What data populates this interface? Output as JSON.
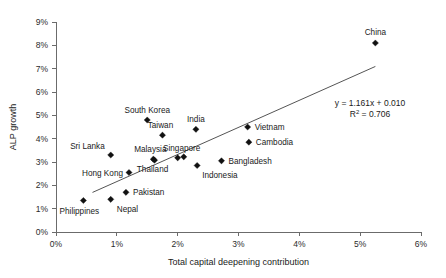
{
  "chart_data": {
    "type": "scatter",
    "title": "",
    "xlabel": "Total capital deepening contribution",
    "ylabel": "ALP growth",
    "xlim": [
      0,
      6
    ],
    "ylim": [
      0,
      9
    ],
    "xunit": "%",
    "yunit": "%",
    "grid": false,
    "legend": "none",
    "xticks": [
      "0%",
      "1%",
      "2%",
      "3%",
      "4%",
      "5%",
      "6%"
    ],
    "xtickvalues": [
      0,
      1,
      2,
      3,
      4,
      5,
      6
    ],
    "yticks": [
      "0%",
      "1%",
      "2%",
      "3%",
      "4%",
      "5%",
      "6%",
      "7%",
      "8%",
      "9%"
    ],
    "ytickvalues": [
      0,
      1,
      2,
      3,
      4,
      5,
      6,
      7,
      8,
      9
    ],
    "points": [
      {
        "label": "Philippines",
        "x": 0.45,
        "y": 1.35,
        "label_dx": -4,
        "label_dy": 13,
        "anchor": "middle"
      },
      {
        "label": "Nepal",
        "x": 0.9,
        "y": 1.4,
        "label_dx": 6,
        "label_dy": 13,
        "anchor": "start"
      },
      {
        "label": "Sri Lanka",
        "x": 0.9,
        "y": 3.3,
        "label_dx": -6,
        "label_dy": -6,
        "anchor": "end"
      },
      {
        "label": "Pakistan",
        "x": 1.15,
        "y": 1.7,
        "label_dx": 7,
        "label_dy": 3,
        "anchor": "start"
      },
      {
        "label": "Hong Kong",
        "x": 1.2,
        "y": 2.55,
        "label_dx": -6,
        "label_dy": 3,
        "anchor": "end"
      },
      {
        "label": "South Korea",
        "x": 1.5,
        "y": 4.8,
        "label_dx": 0,
        "label_dy": -7,
        "anchor": "middle"
      },
      {
        "label": "Malaysia",
        "x": 1.6,
        "y": 3.12,
        "label_dx": -3,
        "label_dy": -7,
        "anchor": "middle"
      },
      {
        "label": "Thailand",
        "x": 1.62,
        "y": 3.08,
        "label_dx": -2,
        "label_dy": 12,
        "anchor": "middle"
      },
      {
        "label": "Taiwan",
        "x": 1.75,
        "y": 4.15,
        "label_dx": -2,
        "label_dy": -7,
        "anchor": "middle"
      },
      {
        "label": "Singapore",
        "x": 2.0,
        "y": 3.18,
        "label_dx": 4,
        "label_dy": -7,
        "anchor": "middle"
      },
      {
        "label": "",
        "x": 2.1,
        "y": 3.22,
        "label_dx": 0,
        "label_dy": 0,
        "anchor": "middle"
      },
      {
        "label": "India",
        "x": 2.3,
        "y": 4.4,
        "label_dx": 0,
        "label_dy": -7,
        "anchor": "middle"
      },
      {
        "label": "Indonesia",
        "x": 2.32,
        "y": 2.85,
        "label_dx": 5,
        "label_dy": 12,
        "anchor": "start"
      },
      {
        "label": "Bangladesh",
        "x": 2.72,
        "y": 3.05,
        "label_dx": 7,
        "label_dy": 3,
        "anchor": "start"
      },
      {
        "label": "Vietnam",
        "x": 3.15,
        "y": 4.5,
        "label_dx": 7,
        "label_dy": 3,
        "anchor": "start"
      },
      {
        "label": "Cambodia",
        "x": 3.17,
        "y": 3.85,
        "label_dx": 7,
        "label_dy": 3,
        "anchor": "start"
      },
      {
        "label": "China",
        "x": 5.25,
        "y": 8.1,
        "label_dx": 0,
        "label_dy": -8,
        "anchor": "middle"
      }
    ],
    "trendline": {
      "slope": 1.161,
      "intercept": 0.01,
      "x_start": 0.6,
      "x_end": 5.25,
      "equation": "y = 1.161x + 0.010",
      "r_squared_prefix": "R",
      "r_squared_sup": "2",
      "r_squared_value": " = 0.706"
    }
  }
}
